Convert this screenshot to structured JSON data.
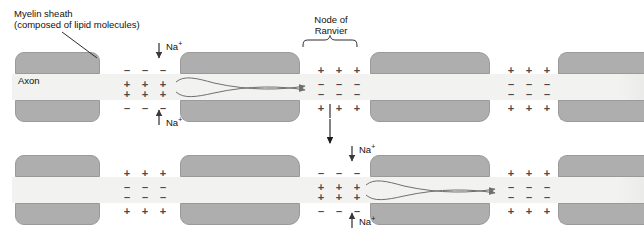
{
  "figure": {
    "type": "biology-diagram"
  },
  "labels": {
    "myelin_line1": "Myelin sheath",
    "myelin_line2": "(composed of lipid molecules)",
    "axon": "Axon",
    "node_line1": "Node of",
    "node_line2": "Ranvier",
    "sodium": "Na",
    "sodium_charge": "+"
  },
  "charges": {
    "positive": "+",
    "negative": "–"
  },
  "panels": [
    {
      "name": "top-panel",
      "active_node_index": 0,
      "nodes": [
        {
          "name": "node-active",
          "state": "depolarized",
          "outer": "–",
          "inner": "+",
          "columns": 3
        },
        {
          "name": "node-resting-1",
          "state": "resting",
          "outer": "+",
          "inner": "–",
          "columns": 3
        },
        {
          "name": "node-resting-2",
          "state": "resting",
          "outer": "+",
          "inner": "–",
          "columns": 3
        }
      ],
      "local_current": "forward-loop-to-next-node"
    },
    {
      "name": "bottom-panel",
      "active_node_index": 1,
      "nodes": [
        {
          "name": "node-resting-1",
          "state": "resting",
          "outer": "+",
          "inner": "–",
          "columns": 3
        },
        {
          "name": "node-active",
          "state": "depolarized",
          "outer": "–",
          "inner": "+",
          "columns": 3
        },
        {
          "name": "node-resting-2",
          "state": "resting",
          "outer": "+",
          "inner": "–",
          "columns": 3
        }
      ],
      "local_current": "forward-loop-to-next-node"
    }
  ],
  "colors": {
    "myelin": "#aeaeae",
    "myelin_border": "#9a9a9a",
    "axoplasm": "#f2f2f0",
    "charge": "#4a4a4a",
    "arrow": "#6f6f6f",
    "text": "#111111",
    "background": "#ffffff"
  }
}
